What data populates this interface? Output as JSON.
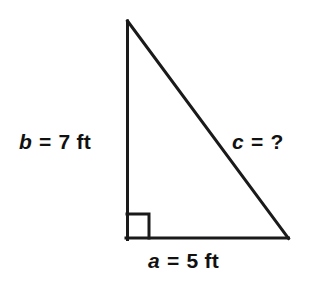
{
  "figure": {
    "kind": "right-triangle-diagram",
    "background_color": "#ffffff",
    "stroke_color": "#1a1a1a",
    "stroke_width": 3,
    "vertices": {
      "apex": {
        "x": 127,
        "y": 21
      },
      "right_angle": {
        "x": 127,
        "y": 238
      },
      "base_right": {
        "x": 288,
        "y": 238
      }
    },
    "right_angle_marker": {
      "name": "right-angle-square",
      "x": 127,
      "y": 214,
      "size": 22,
      "visible": true
    }
  },
  "labels": {
    "leg_vertical": {
      "variable": "b",
      "equals": "=",
      "value": "7",
      "unit": "ft",
      "full_text": "b = 7 ft"
    },
    "leg_horizontal": {
      "variable": "a",
      "equals": "=",
      "value": "5",
      "unit": "ft",
      "full_text": "a = 5 ft"
    },
    "hypotenuse": {
      "variable": "c",
      "equals": "=",
      "value": "?",
      "unit": "",
      "full_text": "c = ?"
    }
  }
}
